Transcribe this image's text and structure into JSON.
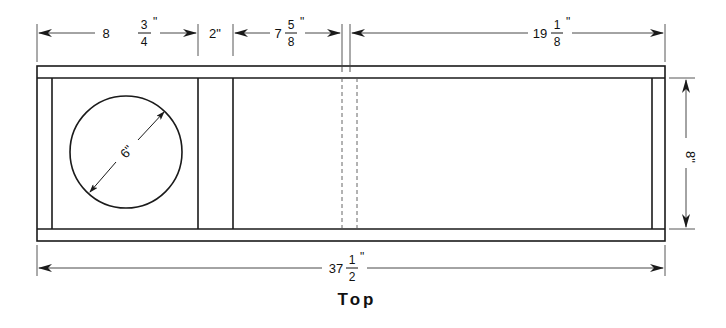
{
  "drawing": {
    "view_label": "Top",
    "colors": {
      "line": "#1a1a1a",
      "dim_line": "#333333",
      "background": "#ffffff"
    },
    "dimensions": {
      "left_chamber": {
        "whole": "8",
        "numerator": "3",
        "denominator": "4",
        "unit": "\""
      },
      "divider_gap": {
        "text": "2\""
      },
      "middle_section": {
        "whole": "7",
        "numerator": "5",
        "denominator": "8",
        "unit": "\""
      },
      "right_section": {
        "whole": "19",
        "numerator": "1",
        "denominator": "8",
        "unit": "\""
      },
      "overall_length": {
        "whole": "37",
        "numerator": "1",
        "denominator": "2",
        "unit": "\""
      },
      "height": {
        "text": "8\""
      },
      "hole_diameter": {
        "text": "6\""
      }
    }
  }
}
